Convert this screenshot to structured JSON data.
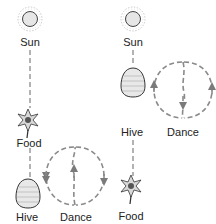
{
  "panels": [
    {
      "id": "food-between-sun-and-hive",
      "labels": {
        "sun": "Sun",
        "food": "Food",
        "hive": "Hive",
        "dance": "Dance"
      },
      "waggle_direction": "up"
    },
    {
      "id": "food-opposite-sun",
      "labels": {
        "sun": "Sun",
        "hive": "Hive",
        "dance": "Dance",
        "food": "Food"
      },
      "waggle_direction": "down"
    }
  ],
  "colors": {
    "line": "#8a8a8a",
    "outline": "#333333",
    "text": "#222222"
  },
  "icons": {
    "sun": "sun-icon",
    "food": "flower-icon",
    "hive": "beehive-icon"
  }
}
